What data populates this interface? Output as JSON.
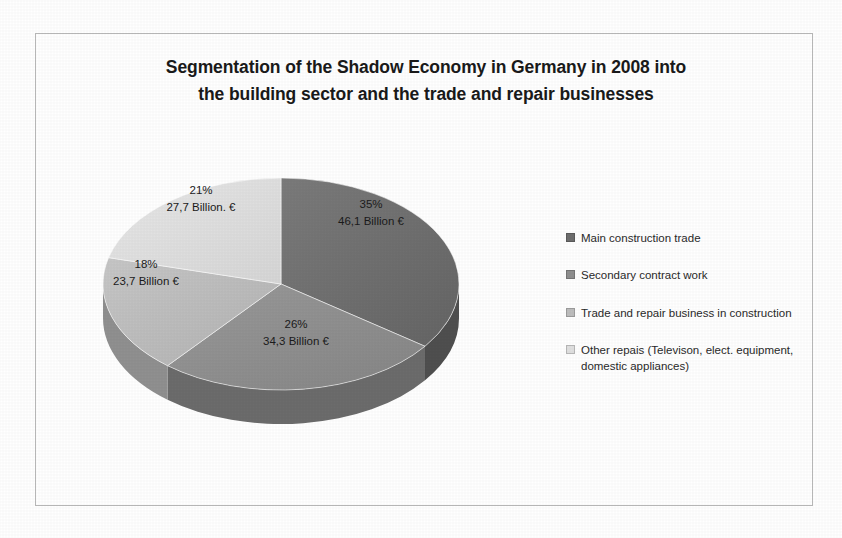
{
  "chart_data": {
    "type": "pie",
    "title": "Segmentation of the Shadow Economy in Germany in 2008 into the building sector and  the trade and repair businesses",
    "title_lines": [
      "Segmentation of the Shadow Economy in Germany in 2008 into",
      "the building sector and  the trade and repair businesses"
    ],
    "unit": "Billion €",
    "categories": [
      "Main construction trade",
      "Secondary contract work",
      "Trade and repair business in construction",
      "Other repais (Televison, elect. equipment, domestic appliances)"
    ],
    "values": [
      46.1,
      34.3,
      23.7,
      27.7
    ],
    "percentages": [
      35,
      26,
      18,
      21
    ],
    "slice_labels": [
      {
        "pct": "35%",
        "value": "46,1 Billion €"
      },
      {
        "pct": "26%",
        "value": "34,3 Billion €"
      },
      {
        "pct": "18%",
        "value": "23,7 Billion €"
      },
      {
        "pct": "21%",
        "value": "27,7 Billion. €"
      }
    ],
    "colors": [
      "#6e6e6e",
      "#8f8f8f",
      "#bdbdbd",
      "#e0e0e0"
    ],
    "side_colors": [
      "#4f4f4f",
      "#6c6c6c",
      "#909090",
      "#b4b4b4"
    ],
    "legend_position": "right",
    "grid": false,
    "three_d": true,
    "start_angle_deg": 0,
    "direction": "clockwise"
  },
  "legend": {
    "items": [
      {
        "label": "Main construction trade",
        "color": "#6e6e6e"
      },
      {
        "label": "Secondary contract work",
        "color": "#8f8f8f"
      },
      {
        "label": "Trade and repair business in construction",
        "color": "#bdbdbd"
      },
      {
        "label": "Other repais (Televison, elect. equipment, domestic appliances)",
        "color": "#e0e0e0"
      }
    ]
  },
  "frame": {
    "border_color": "#b9b9b9",
    "background": "#ffffff"
  }
}
